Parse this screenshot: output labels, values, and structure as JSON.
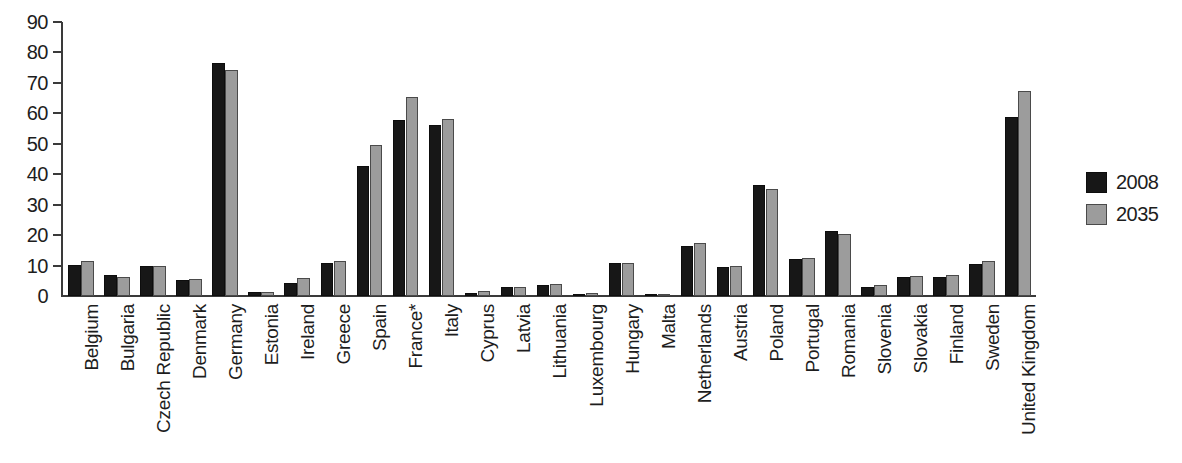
{
  "chart_data": {
    "type": "bar",
    "title": "",
    "subtitle": "",
    "xlabel": "",
    "ylabel": "",
    "ylim": [
      0,
      90
    ],
    "yticks": [
      0,
      10,
      20,
      30,
      40,
      50,
      60,
      70,
      80,
      90
    ],
    "grid": false,
    "legend_position": "right",
    "orientation": "vertical",
    "x_tick_label_rotation": 90,
    "categories": [
      "Belgium",
      "Bulgaria",
      "Czech Republic",
      "Denmark",
      "Germany",
      "Estonia",
      "Ireland",
      "Greece",
      "Spain",
      "France*",
      "Italy",
      "Cyprus",
      "Latvia",
      "Lithuania",
      "Luxembourg",
      "Hungary",
      "Malta",
      "Netherlands",
      "Austria",
      "Poland",
      "Portugal",
      "Romania",
      "Slovenia",
      "Slovakia",
      "Finland",
      "Sweden",
      "United Kingdom"
    ],
    "series": [
      {
        "name": "2008",
        "color": "#171717",
        "values": [
          10.3,
          7.0,
          9.8,
          5.3,
          76.6,
          1.2,
          4.4,
          11.0,
          42.8,
          57.8,
          56.2,
          1.1,
          2.9,
          3.7,
          0.4,
          10.7,
          0.3,
          16.4,
          9.4,
          36.5,
          12.0,
          21.2,
          3.1,
          6.4,
          6.4,
          10.6,
          58.8
        ]
      },
      {
        "name": "2035",
        "color": "#9c9c9c",
        "values": [
          11.4,
          6.2,
          10.0,
          5.6,
          74.3,
          1.2,
          6.0,
          11.4,
          49.6,
          65.4,
          58.0,
          1.6,
          3.1,
          3.9,
          0.9,
          10.8,
          0.3,
          17.4,
          10.0,
          35.0,
          12.6,
          20.4,
          3.5,
          6.5,
          6.9,
          11.4,
          67.4
        ]
      }
    ],
    "footnote_marker": "*"
  },
  "legend": {
    "items": [
      {
        "label": "2008",
        "swatch": "s2008"
      },
      {
        "label": "2035",
        "swatch": "s2035"
      }
    ]
  }
}
